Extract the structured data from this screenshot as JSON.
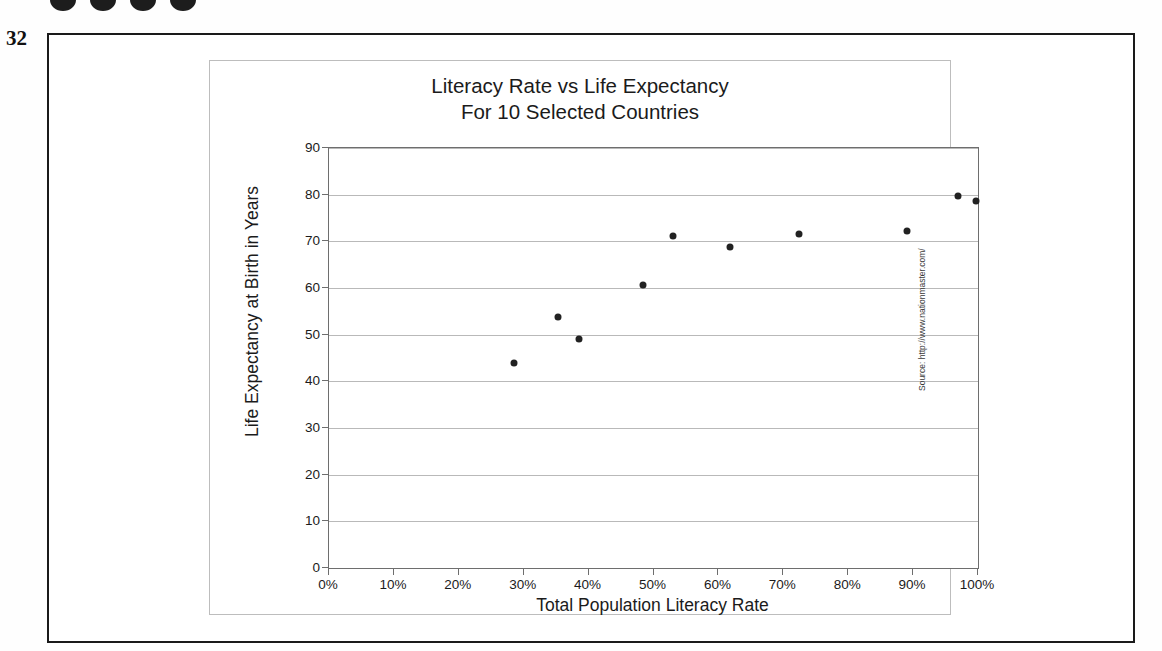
{
  "page": {
    "page_number": "32",
    "binding_holes": 4
  },
  "chart_data": {
    "type": "scatter",
    "title": "Literacy Rate vs Life Expectancy",
    "subtitle": "For 10 Selected Countries",
    "xlabel": "Total Population Literacy Rate",
    "ylabel": "Life Expectancy at Birth in Years",
    "source": "Source: http://www.nationmaster.com/",
    "xlim": [
      0,
      100
    ],
    "ylim": [
      0,
      90
    ],
    "xticks": [
      0,
      10,
      20,
      30,
      40,
      50,
      60,
      70,
      80,
      90,
      100
    ],
    "xtick_labels": [
      "0%",
      "10%",
      "20%",
      "30%",
      "40%",
      "50%",
      "60%",
      "70%",
      "80%",
      "90%",
      "100%"
    ],
    "yticks": [
      0,
      10,
      20,
      30,
      40,
      50,
      60,
      70,
      80,
      90
    ],
    "ytick_labels": [
      "0",
      "10",
      "20",
      "30",
      "40",
      "50",
      "60",
      "70",
      "80",
      "90"
    ],
    "grid": "horizontal",
    "legend": "none",
    "marker_color": "#222222",
    "points": [
      {
        "x": 28.5,
        "y": 43.9
      },
      {
        "x": 35.3,
        "y": 53.8
      },
      {
        "x": 38.5,
        "y": 49.1
      },
      {
        "x": 48.4,
        "y": 60.6
      },
      {
        "x": 53.0,
        "y": 71.2
      },
      {
        "x": 61.8,
        "y": 68.8
      },
      {
        "x": 72.4,
        "y": 71.6
      },
      {
        "x": 89.1,
        "y": 72.3
      },
      {
        "x": 96.9,
        "y": 79.7
      },
      {
        "x": 99.7,
        "y": 78.6
      }
    ]
  }
}
